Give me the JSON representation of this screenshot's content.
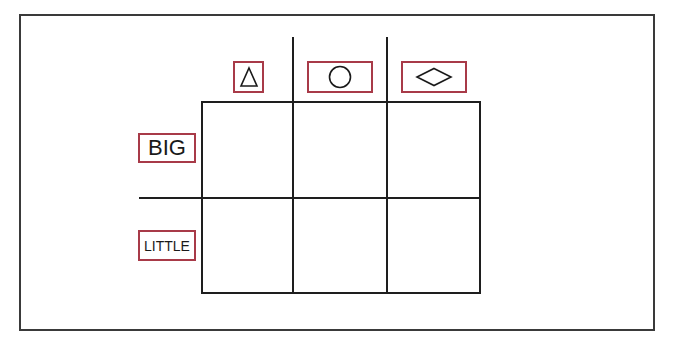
{
  "diagram": {
    "type": "2x3 classification grid",
    "columns": [
      {
        "shape": "triangle",
        "icon": "triangle-icon"
      },
      {
        "shape": "circle",
        "icon": "circle-icon"
      },
      {
        "shape": "diamond",
        "icon": "diamond-icon"
      }
    ],
    "rows": [
      {
        "label": "BIG"
      },
      {
        "label": "LITTLE"
      }
    ],
    "cells": [
      [
        "",
        "",
        ""
      ],
      [
        "",
        "",
        ""
      ]
    ],
    "colors": {
      "label_border": "#a83a48",
      "grid_line": "#1e1e1e",
      "frame": "#3a3a3a"
    }
  }
}
